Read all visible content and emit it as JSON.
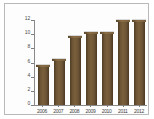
{
  "chart_data": {
    "type": "bar",
    "title": "",
    "xlabel": "",
    "ylabel": "",
    "categories": [
      "2006",
      "2007",
      "2008",
      "2009",
      "2010",
      "2011",
      "2012"
    ],
    "values": [
      5.5,
      6.4,
      9.6,
      10.2,
      10.2,
      11.9,
      11.9
    ],
    "ylim": [
      0,
      12
    ],
    "yticks": [
      0,
      2,
      4,
      6,
      8,
      10,
      12
    ],
    "ytick_labels": [
      "0",
      "2",
      "4",
      "6",
      "8",
      "10",
      "12"
    ],
    "grid": false,
    "legend": null,
    "series_color": "#6d5536"
  },
  "figure": {
    "background_color": "#ffffff",
    "frame_color": "#b9b9b9",
    "axis_color": "#8a8a8a"
  }
}
